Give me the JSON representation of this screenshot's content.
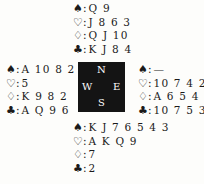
{
  "hands": {
    "north": {
      "spades": "Q 9",
      "hearts": "J 8 6 3",
      "diamonds": "Q J 10",
      "clubs": "K J 8 4"
    },
    "west": {
      "spades": "A 10 8 2",
      "hearts": "5",
      "diamonds": "K 9 8 2",
      "clubs": "A Q 9 6"
    },
    "east": {
      "spades": "—",
      "hearts": "10 7 4 2",
      "diamonds": "A 6 5 4 3",
      "clubs": "10 7 5 3"
    },
    "south": {
      "spades": "K J 7 6 5 4 3",
      "hearts": "A K Q 9",
      "diamonds": "7",
      "clubs": "2"
    }
  },
  "symbols": {
    "spades": "♠",
    "hearts": "♡",
    "diamonds": "♢",
    "clubs": "♣",
    "colon": ":"
  },
  "compass": {
    "north": "N",
    "south": "S",
    "west": "W",
    "east": "E",
    "background": "#141414"
  }
}
